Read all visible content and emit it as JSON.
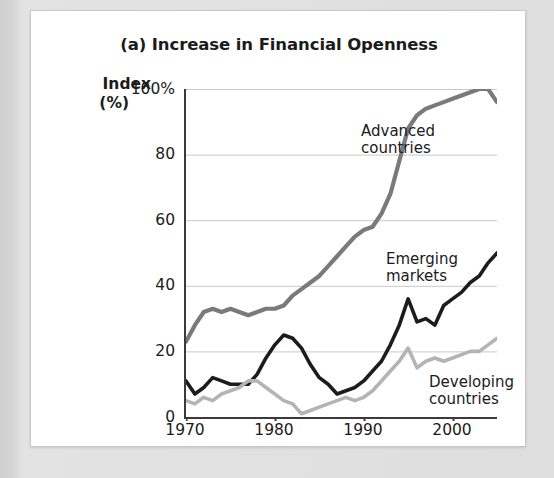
{
  "chart_data": {
    "type": "line",
    "title": "(a) Increase in Financial Openness",
    "xlabel": "",
    "ylabel": "Index (%)",
    "ylabel_line1": "Index",
    "ylabel_line2": "(%)",
    "xlim": [
      1970,
      2005
    ],
    "ylim": [
      0,
      100
    ],
    "grid": true,
    "legend_position": "inline-annotations",
    "y_ticks": [
      0,
      20,
      40,
      60,
      80,
      100
    ],
    "y_tick_labels": [
      "0",
      "20",
      "40",
      "60",
      "80",
      "100%"
    ],
    "x_ticks": [
      1970,
      1980,
      1990,
      2000
    ],
    "x_tick_labels": [
      "1970",
      "1980",
      "1990",
      "2000"
    ],
    "x": [
      1970,
      1971,
      1972,
      1973,
      1974,
      1975,
      1976,
      1977,
      1978,
      1979,
      1980,
      1981,
      1982,
      1983,
      1984,
      1985,
      1986,
      1987,
      1988,
      1989,
      1990,
      1991,
      1992,
      1993,
      1994,
      1995,
      1996,
      1997,
      1998,
      1999,
      2000,
      2001,
      2002,
      2003,
      2004,
      2005
    ],
    "series": [
      {
        "name": "Advanced countries",
        "label_line1": "Advanced",
        "label_line2": "countries",
        "color": "#7a7a7a",
        "values": [
          23,
          28,
          32,
          33,
          32,
          33,
          32,
          31,
          32,
          33,
          33,
          34,
          37,
          39,
          41,
          43,
          46,
          49,
          52,
          55,
          57,
          58,
          62,
          68,
          78,
          88,
          92,
          94,
          95,
          96,
          97,
          98,
          99,
          100,
          100,
          96
        ]
      },
      {
        "name": "Emerging markets",
        "label_line1": "Emerging",
        "label_line2": "markets",
        "color": "#1c1c1c",
        "values": [
          11,
          7,
          9,
          12,
          11,
          10,
          10,
          10,
          13,
          18,
          22,
          25,
          24,
          21,
          16,
          12,
          10,
          7,
          8,
          9,
          11,
          14,
          17,
          22,
          28,
          36,
          29,
          30,
          28,
          34,
          36,
          38,
          41,
          43,
          47,
          50
        ]
      },
      {
        "name": "Developing countries",
        "label_line1": "Developing",
        "label_line2": "countries",
        "color": "#b4b4b4",
        "values": [
          5,
          4,
          6,
          5,
          7,
          8,
          9,
          11,
          11,
          9,
          7,
          5,
          4,
          1,
          2,
          3,
          4,
          5,
          6,
          5,
          6,
          8,
          11,
          14,
          17,
          21,
          15,
          17,
          18,
          17,
          18,
          19,
          20,
          20,
          22,
          24
        ]
      }
    ]
  },
  "figure": {
    "panel_label": "(a)"
  }
}
